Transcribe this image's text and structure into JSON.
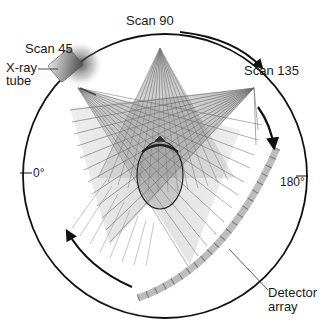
{
  "diagram": {
    "labels": {
      "scan_45": "Scan 45",
      "scan_90": "Scan 90",
      "scan_135": "Scan 135",
      "xray_tube_line1": "X-ray",
      "xray_tube_line2": "tube",
      "angle_0": "0°",
      "angle_180": "180°",
      "detector_line1": "Detector",
      "detector_line2": "array"
    },
    "elements": [
      {
        "id": "gantry-circle",
        "type": "circle",
        "desc": "outer gantry ring"
      },
      {
        "id": "xray-tube",
        "type": "source",
        "desc": "X-ray tube at Scan 45 position"
      },
      {
        "id": "beam-fans",
        "type": "fan-beams",
        "count": 3,
        "positions": [
          "Scan 45",
          "Scan 90",
          "Scan 135"
        ]
      },
      {
        "id": "patient",
        "type": "ellipse",
        "desc": "patient cross-section at center"
      },
      {
        "id": "detector-array",
        "type": "arc",
        "desc": "segmented detector arc"
      },
      {
        "id": "rotation-arrows",
        "type": "arrows",
        "desc": "clockwise rotation direction"
      }
    ],
    "colors": {
      "ring": "#111111",
      "beam": "#777777",
      "detector": "#bdbdbd",
      "detector_tick": "#555555",
      "tube": "#8a8a8a"
    }
  }
}
